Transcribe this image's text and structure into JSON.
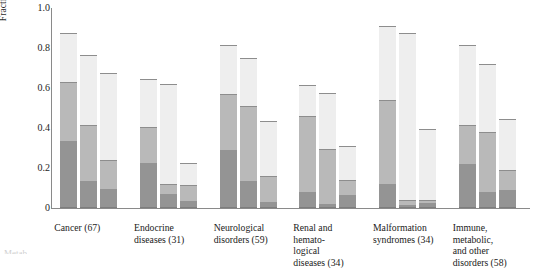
{
  "chart_data": {
    "type": "bar",
    "subtype": "grouped-stacked-bar",
    "title": "",
    "xlabel": "",
    "ylabel": "Fraction of human genes",
    "ylim": [
      0,
      1.0
    ],
    "yticks": [
      "0",
      "0.2",
      "0.4",
      "0.6",
      "0.8",
      "1.0"
    ],
    "ytick_values": [
      0,
      0.2,
      0.4,
      0.6,
      0.8,
      1.0
    ],
    "grid": false,
    "legend": "none",
    "bars_per_group": 3,
    "segment_colors": [
      "#eeeeee",
      "#b9b9b9",
      "#949494",
      "#6e6e6e"
    ],
    "categories": [
      "Cancer (67)",
      "Endocrine\ndiseases (31)",
      "Neurological\ndisorders (59)",
      "Renal and\nhemato-\nlogical\ndiseases (34)",
      "Malformation\nsyndromes (34)",
      "Immune,\nmetabolic,\nand other\ndisorders (58)"
    ],
    "category_counts": [
      67,
      31,
      59,
      34,
      34,
      58
    ],
    "groups": [
      {
        "label": "Cancer (67)",
        "bars": [
          {
            "total": 0.87,
            "boundaries": [
              0.33,
              0.625,
              0.87
            ]
          },
          {
            "total": 0.76,
            "boundaries": [
              0.13,
              0.41,
              0.76
            ]
          },
          {
            "total": 0.67,
            "boundaries": [
              0.09,
              0.235,
              0.67
            ]
          }
        ]
      },
      {
        "label": "Endocrine diseases (31)",
        "bars": [
          {
            "total": 0.64,
            "boundaries": [
              0.22,
              0.4,
              0.64
            ]
          },
          {
            "total": 0.615,
            "boundaries": [
              0.065,
              0.115,
              0.615
            ]
          },
          {
            "total": 0.22,
            "boundaries": [
              0.03,
              0.11,
              0.22
            ]
          }
        ]
      },
      {
        "label": "Neurological disorders (59)",
        "bars": [
          {
            "total": 0.81,
            "boundaries": [
              0.285,
              0.565,
              0.81
            ]
          },
          {
            "total": 0.745,
            "boundaries": [
              0.13,
              0.505,
              0.745
            ]
          },
          {
            "total": 0.43,
            "boundaries": [
              0.025,
              0.155,
              0.43
            ]
          }
        ]
      },
      {
        "label": "Renal and hematological diseases (34)",
        "bars": [
          {
            "total": 0.61,
            "boundaries": [
              0.075,
              0.455,
              0.61
            ]
          },
          {
            "total": 0.57,
            "boundaries": [
              0.015,
              0.29,
              0.57
            ]
          },
          {
            "total": 0.305,
            "boundaries": [
              0.06,
              0.135,
              0.305
            ]
          }
        ]
      },
      {
        "label": "Malformation syndromes (34)",
        "bars": [
          {
            "total": 0.905,
            "boundaries": [
              0.115,
              0.535,
              0.905
            ]
          },
          {
            "total": 0.87,
            "boundaries": [
              0.01,
              0.035,
              0.87
            ]
          },
          {
            "total": 0.39,
            "boundaries": [
              0.02,
              0.035,
              0.39
            ]
          }
        ]
      },
      {
        "label": "Immune, metabolic, and other disorders (58)",
        "bars": [
          {
            "total": 0.81,
            "boundaries": [
              0.215,
              0.41,
              0.81
            ]
          },
          {
            "total": 0.715,
            "boundaries": [
              0.075,
              0.375,
              0.715
            ]
          },
          {
            "total": 0.44,
            "boundaries": [
              0.085,
              0.185,
              0.44
            ]
          }
        ]
      }
    ]
  },
  "axis": {
    "ylabel": "Fraction of human genes"
  },
  "caption_cutoff": "Metab"
}
